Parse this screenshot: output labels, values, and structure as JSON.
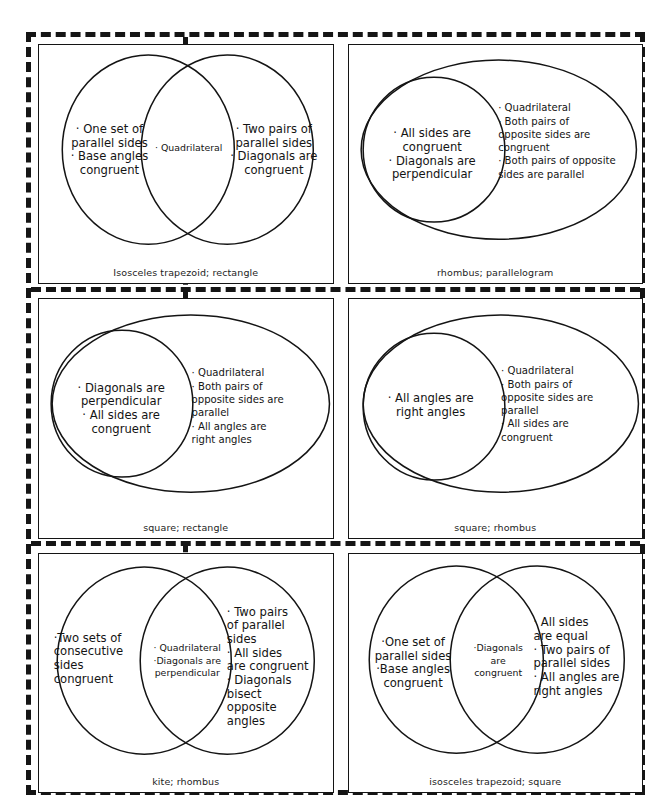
{
  "sheet": {
    "title": "Quadrilateral Properties Venn Diagram Cards",
    "cut_lines": "dashed",
    "columns": 2,
    "rows": 3,
    "ink_color": "#141414",
    "background_color": "#ffffff"
  },
  "cards": [
    {
      "id": "card-1",
      "layout": "two-overlapping-ellipses",
      "caption": "Isosceles trapezoid; rectangle",
      "regions": {
        "left": "· One set of\nparallel sides\n· Base angles\ncongruent",
        "middle": "· Quadrilateral",
        "right": "· Two pairs of\nparallel sides\n· Diagonals are\ncongruent"
      }
    },
    {
      "id": "card-2",
      "layout": "circle-inside-ellipse",
      "caption": "rhombus; parallelogram",
      "regions": {
        "inner": "· All sides are\ncongruent\n· Diagonals are\nperpendicular",
        "outer": "· Quadrilateral\n· Both pairs of\n   opposite sides are\n   congruent\n· Both pairs of opposite\n   sides are parallel"
      }
    },
    {
      "id": "card-3",
      "layout": "circle-inside-ellipse",
      "caption": "square; rectangle",
      "regions": {
        "inner": "· Diagonals are\nperpendicular\n· All sides are\ncongruent",
        "outer": "· Quadrilateral\n· Both pairs of\n   opposite sides are\n   parallel\n· All angles are\n   right angles"
      }
    },
    {
      "id": "card-4",
      "layout": "circle-inside-ellipse",
      "caption": "square; rhombus",
      "regions": {
        "inner": "· All angles are\nright angles",
        "outer": "· Quadrilateral\n· Both pairs of\n   opposite sides are\n   parallel\n· All sides are\n   congruent"
      }
    },
    {
      "id": "card-5",
      "layout": "two-overlapping-ellipses",
      "caption": "kite; rhombus",
      "regions": {
        "left": "·Two sets of\nconsecutive\nsides\ncongruent",
        "middle": "· Quadrilateral\n·Diagonals are\nperpendicular",
        "right": "· Two pairs\nof parallel\nsides\n· All sides\nare congruent\n· Diagonals\nbisect\nopposite\nangles"
      }
    },
    {
      "id": "card-6",
      "layout": "two-overlapping-ellipses",
      "caption": "isosceles trapezoid; square",
      "regions": {
        "left": "·One set of\nparallel sides\n·Base angles\ncongruent",
        "middle": "·Diagonals\nare\ncongruent",
        "right": "· All sides\nare equal\n· Two pairs of\nparallel sides\n· All angles are\nright angles"
      }
    }
  ]
}
